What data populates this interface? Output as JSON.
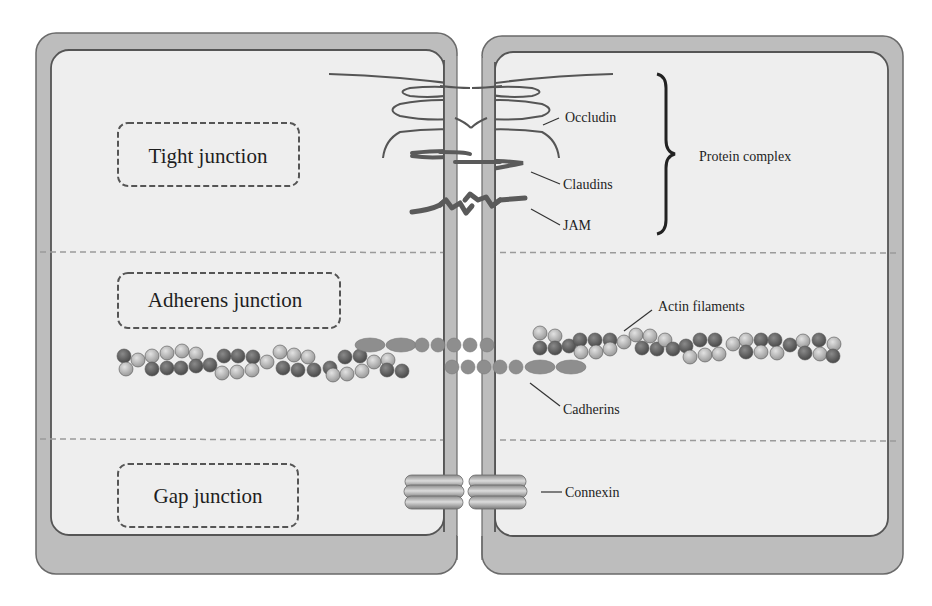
{
  "diagram": {
    "type": "cell-junctions",
    "cells": [
      "left-cell",
      "right-cell"
    ],
    "junctions": [
      {
        "id": "tight",
        "label": "Tight junction"
      },
      {
        "id": "adherens",
        "label": "Adherens junction"
      },
      {
        "id": "gap",
        "label": "Gap junction"
      }
    ],
    "proteins": {
      "occludin": "Occludin",
      "claudins": "Claudins",
      "jam": "JAM",
      "actin": "Actin filaments",
      "cadherins": "Cadherins",
      "connexin": "Connexin"
    },
    "group_label": "Protein complex",
    "colors": {
      "membrane_outer": "#bdbdbd",
      "cytoplasm": "#eeeeee",
      "outline": "#5a5a5a",
      "protein_line": "#555555",
      "actin_dark": "#5e5e5e",
      "actin_light": "#b4b4b4",
      "cadherin": "#8e8e8e",
      "connexin": "#a8a8a8"
    }
  }
}
